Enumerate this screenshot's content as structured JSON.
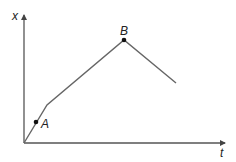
{
  "diagram": {
    "type": "position-time graph",
    "axes": {
      "x_axis_label": "t",
      "y_axis_label": "x"
    },
    "points": [
      {
        "name": "A",
        "label": "A"
      },
      {
        "name": "B",
        "label": "B"
      }
    ],
    "colors": {
      "axis": "#555555",
      "line": "#666666",
      "point": "#111111",
      "text": "#222222"
    }
  }
}
